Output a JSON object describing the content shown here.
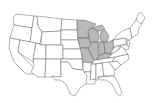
{
  "map": {
    "title": "United States map with highlighted Midwest states",
    "colors": {
      "background": "#ffffff",
      "default_fill": "#ffffff",
      "highlight_fill": "#b9b9b9",
      "border": "#555555"
    },
    "highlighted_states": [
      "Minnesota",
      "Wisconsin",
      "Michigan",
      "Iowa",
      "Missouri",
      "Illinois",
      "Indiana",
      "Ohio",
      "Kentucky"
    ]
  }
}
